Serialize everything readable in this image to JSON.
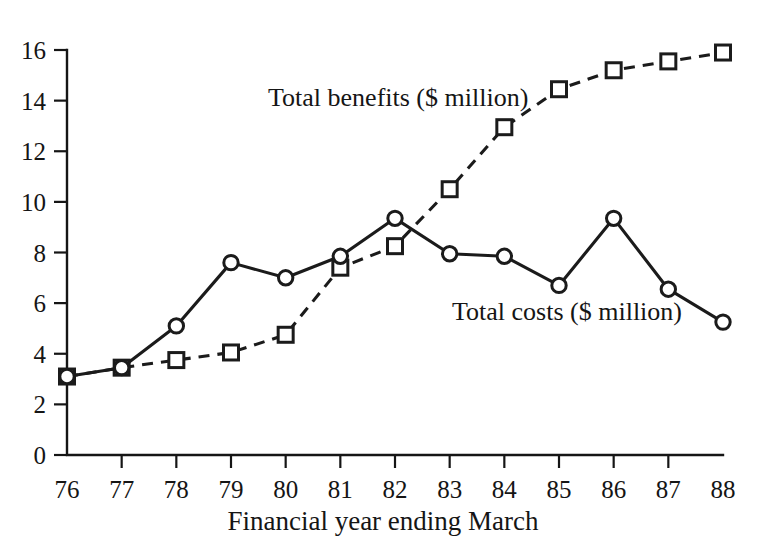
{
  "chart_data": {
    "type": "line",
    "title": "",
    "xlabel": "Financial year ending March",
    "ylabel": "",
    "xlim": [
      76,
      88
    ],
    "ylim": [
      0,
      16
    ],
    "ytick_step": 2,
    "grid": false,
    "legend_position": "inline-annotation",
    "categories": [
      "76",
      "77",
      "78",
      "79",
      "80",
      "81",
      "82",
      "83",
      "84",
      "85",
      "86",
      "87",
      "88"
    ],
    "x": [
      76,
      77,
      78,
      79,
      80,
      81,
      82,
      83,
      84,
      85,
      86,
      87,
      88
    ],
    "xticklabels": [
      "76",
      "77",
      "78",
      "79",
      "80",
      "81",
      "82",
      "83",
      "84",
      "85",
      "86",
      "87",
      "88"
    ],
    "yticklabels": [
      "0",
      "2",
      "4",
      "6",
      "8",
      "10",
      "12",
      "14",
      "16"
    ],
    "yticks": [
      0,
      2,
      4,
      6,
      8,
      10,
      12,
      14,
      16
    ],
    "series": [
      {
        "name": "Total benefits ($ million)",
        "marker": "square",
        "linestyle": "dashed",
        "color": "#1b1b1b",
        "values": [
          3.1,
          3.45,
          3.75,
          4.05,
          4.75,
          7.4,
          8.25,
          10.5,
          12.95,
          14.45,
          15.2,
          15.55,
          15.9
        ]
      },
      {
        "name": "Total costs ($ million)",
        "marker": "circle",
        "linestyle": "solid",
        "color": "#1b1b1b",
        "values": [
          3.1,
          3.45,
          5.1,
          7.6,
          7.0,
          7.85,
          9.35,
          7.95,
          7.85,
          6.7,
          9.35,
          6.55,
          5.25
        ]
      }
    ],
    "annotations": [
      {
        "text": "Total benefits ($ million)",
        "x_px": 268,
        "y_px": 106
      },
      {
        "text": "Total costs ($ million)",
        "x_px": 452,
        "y_px": 320
      }
    ]
  },
  "axis": {
    "x_title": "Financial year ending March"
  }
}
